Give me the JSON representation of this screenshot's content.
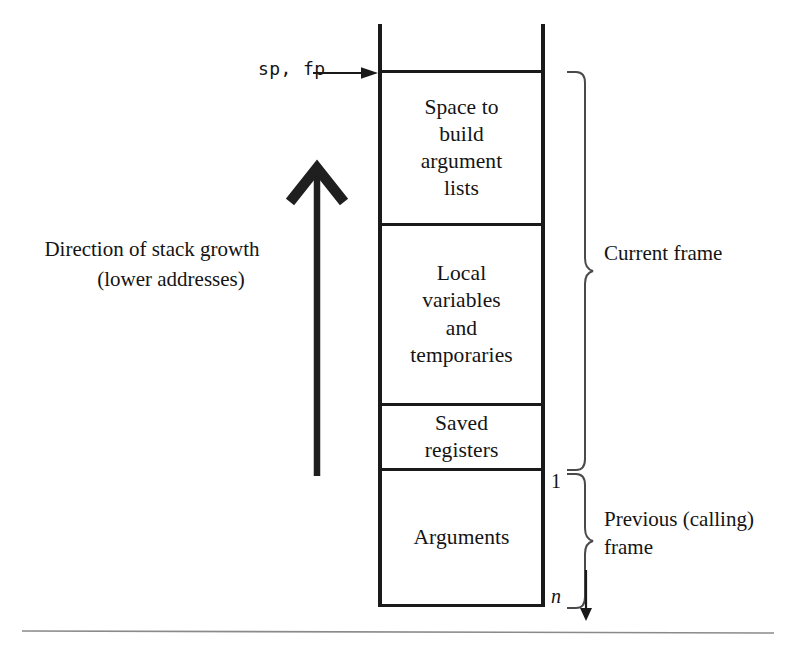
{
  "diagram": {
    "pointer_label": "sp, fp",
    "growth_caption_line1": "Direction of stack growth",
    "growth_caption_line2": "(lower addresses)",
    "stack_cells": [
      {
        "id": "argument-build-space",
        "lines": [
          "Space to",
          "build",
          "argument",
          "lists"
        ]
      },
      {
        "id": "locals-temporaries",
        "lines": [
          "Local",
          "variables",
          "and",
          "temporaries"
        ]
      },
      {
        "id": "saved-registers",
        "lines": [
          "Saved",
          "registers"
        ]
      },
      {
        "id": "arguments",
        "lines": [
          "Arguments"
        ]
      }
    ],
    "brace_labels": [
      {
        "id": "current-frame",
        "text": "Current frame"
      },
      {
        "id": "previous-frame",
        "line1": "Previous (calling)",
        "line2": "frame"
      }
    ],
    "argument_markers": {
      "first": "1",
      "last": "n"
    },
    "colors": {
      "ink": "#1a1a1a",
      "text": "#141414",
      "brace": "#4a4a4a",
      "rule": "#8a8a8a",
      "background": "#ffffff"
    }
  }
}
